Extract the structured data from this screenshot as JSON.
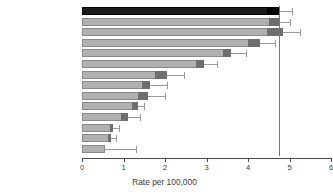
{
  "chart_data": {
    "type": "bar",
    "orientation": "horizontal",
    "title": "",
    "xlabel": "Rate per 100,000",
    "ylabel": "",
    "xlim": [
      0,
      6
    ],
    "xticks": [
      0,
      1,
      2,
      3,
      4,
      5,
      6
    ],
    "xtick_labels": [
      "0",
      "1",
      "2",
      "3",
      "4",
      "5",
      "6"
    ],
    "grid": false,
    "legend": "none",
    "reference_line": 4.75,
    "categories": [
      "England and Wales",
      "USA",
      "Sweden",
      "Australia",
      "The Netherlands",
      "Costa Rica",
      "Italy",
      "Brazil",
      "Estonia",
      "Japan",
      "Singapore",
      "India",
      "China",
      "Zimbabwe"
    ],
    "series": [
      {
        "name": "Rate per 100,000",
        "values": [
          4.75,
          4.75,
          4.85,
          4.3,
          3.6,
          2.05,
          2.95,
          1.65,
          1.6,
          1.35,
          1.1,
          0.75,
          0.7,
          0.55
        ]
      }
    ],
    "rows": [
      {
        "label": "England and Wales",
        "value": 4.75,
        "cap_start": 4.45,
        "upper": 5.05,
        "highlight": true
      },
      {
        "label": "USA",
        "value": 4.75,
        "cap_start": 4.5,
        "upper": 5.0,
        "highlight": false
      },
      {
        "label": "Sweden",
        "value": 4.85,
        "cap_start": 4.45,
        "upper": 5.25,
        "highlight": false
      },
      {
        "label": "Australia",
        "value": 4.3,
        "cap_start": 4.0,
        "upper": 4.65,
        "highlight": false
      },
      {
        "label": "The Netherlands",
        "value": 3.6,
        "cap_start": 3.4,
        "upper": 3.95,
        "highlight": false
      },
      {
        "label": "Italy",
        "value": 2.95,
        "cap_start": 2.75,
        "upper": 3.25,
        "highlight": false
      },
      {
        "label": "Costa Rica",
        "value": 2.05,
        "cap_start": 1.75,
        "upper": 2.45,
        "highlight": false
      },
      {
        "label": "Brazil",
        "value": 1.65,
        "cap_start": 1.45,
        "upper": 2.05,
        "highlight": false
      },
      {
        "label": "Estonia",
        "value": 1.6,
        "cap_start": 1.35,
        "upper": 2.0,
        "highlight": false
      },
      {
        "label": "Japan",
        "value": 1.35,
        "cap_start": 1.2,
        "upper": 1.5,
        "highlight": false
      },
      {
        "label": "Singapore",
        "value": 1.1,
        "cap_start": 0.95,
        "upper": 1.4,
        "highlight": false
      },
      {
        "label": "India",
        "value": 0.75,
        "cap_start": 0.68,
        "upper": 0.88,
        "highlight": false
      },
      {
        "label": "China",
        "value": 0.7,
        "cap_start": 0.62,
        "upper": 0.82,
        "highlight": false
      },
      {
        "label": "Zimbabwe",
        "value": 0.55,
        "cap_start": 0.55,
        "upper": 1.3,
        "highlight": false
      }
    ],
    "colors": {
      "bar_fill": "#b0b0b0",
      "bar_cap": "#6e6e6e",
      "highlight_fill": "#1a1a1a",
      "whisker": "#999999",
      "axis": "#4a4a4a",
      "text": "#3b3b3b",
      "reference_line": "#777777",
      "background": "#ffffff"
    }
  }
}
